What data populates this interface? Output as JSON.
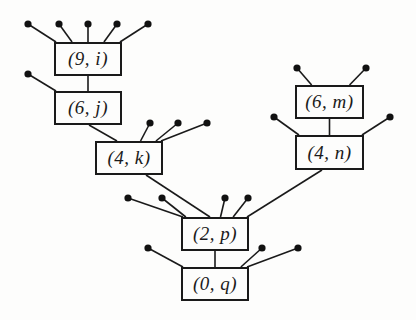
{
  "diagram": {
    "type": "tree",
    "nodes": [
      {
        "id": "n9i",
        "label": "(9, i)",
        "rank": "9",
        "name": "i",
        "x": 54,
        "y": 42,
        "w": 68,
        "h": 34
      },
      {
        "id": "n6j",
        "label": "(6, j)",
        "rank": "6",
        "name": "j",
        "x": 54,
        "y": 91,
        "w": 68,
        "h": 34
      },
      {
        "id": "n4k",
        "label": "(4, k)",
        "rank": "4",
        "name": "k",
        "x": 95,
        "y": 141,
        "w": 68,
        "h": 34
      },
      {
        "id": "n6m",
        "label": "(6, m)",
        "rank": "6",
        "name": "m",
        "x": 295,
        "y": 85,
        "w": 69,
        "h": 34
      },
      {
        "id": "n4n",
        "label": "(4, n)",
        "rank": "4",
        "name": "n",
        "x": 295,
        "y": 135,
        "w": 69,
        "h": 35
      },
      {
        "id": "n2p",
        "label": "(2, p)",
        "rank": "2",
        "name": "p",
        "x": 181,
        "y": 217,
        "w": 68,
        "h": 34
      },
      {
        "id": "n0q",
        "label": "(0, q)",
        "rank": "0",
        "name": "q",
        "x": 181,
        "y": 267,
        "w": 68,
        "h": 34
      }
    ],
    "edges": [
      {
        "from": "n9i",
        "to": "n6j"
      },
      {
        "from": "n6j",
        "to": "n4k"
      },
      {
        "from": "n4k",
        "to": "n2p"
      },
      {
        "from": "n6m",
        "to": "n4n"
      },
      {
        "from": "n4n",
        "to": "n2p"
      },
      {
        "from": "n2p",
        "to": "n0q"
      }
    ],
    "leaf_dots": {
      "n9i": [
        [
          28,
          24
        ],
        [
          59,
          24
        ],
        [
          88,
          24
        ],
        [
          117,
          24
        ],
        [
          148,
          24
        ]
      ],
      "n6j": [
        [
          28,
          74
        ]
      ],
      "n4k": [
        [
          150,
          123
        ],
        [
          178,
          123
        ],
        [
          207,
          123
        ]
      ],
      "n6m": [
        [
          297,
          68
        ],
        [
          366,
          68
        ]
      ],
      "n4n": [
        [
          274,
          117
        ],
        [
          390,
          117
        ]
      ],
      "n2p": [
        [
          128,
          198
        ],
        [
          162,
          198
        ],
        [
          225,
          198
        ],
        [
          248,
          198
        ]
      ],
      "n0q": [
        [
          148,
          248
        ],
        [
          262,
          248
        ],
        [
          298,
          248
        ]
      ]
    }
  }
}
